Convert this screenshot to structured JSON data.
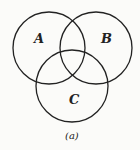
{
  "diagram": {
    "type": "venn",
    "sets": [
      {
        "label": "A",
        "cx": 49,
        "cy": 48,
        "r": 36
      },
      {
        "label": "B",
        "cx": 96,
        "cy": 48,
        "r": 36
      },
      {
        "label": "C",
        "cx": 72,
        "cy": 86,
        "r": 36
      }
    ],
    "caption": "(a)",
    "stroke_color": "#222222"
  }
}
